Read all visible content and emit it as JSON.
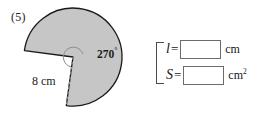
{
  "problem": {
    "number_label": "(5)"
  },
  "figure": {
    "name": "sector-270-radius-8cm",
    "angle_label": "270",
    "degree_symbol": "°",
    "radius_label": "8 cm",
    "fill_color": "#c6c6c6",
    "stroke_color": "#1a1a1a",
    "dashed_color": "#9a9a9a",
    "center_angle_degrees": 270,
    "radius_cm": 8
  },
  "answers": {
    "rows": [
      {
        "variable": "l",
        "equals": "=",
        "value": "",
        "placeholder": "",
        "unit": "cm",
        "unit_exponent": ""
      },
      {
        "variable": "S",
        "equals": "=",
        "value": "",
        "placeholder": "",
        "unit": "cm",
        "unit_exponent": "2"
      }
    ]
  }
}
